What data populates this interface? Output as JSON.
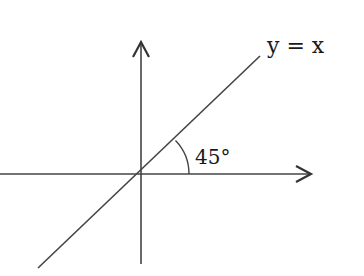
{
  "diagram": {
    "line_label": "y = x",
    "angle_label": "45°",
    "colors": {
      "line": "#444444",
      "text": "#1a1a1a",
      "background": "#ffffff"
    },
    "geometry": {
      "origin": [
        141,
        174
      ],
      "x_axis": {
        "from": [
          0,
          174
        ],
        "to": [
          312,
          174
        ]
      },
      "y_axis": {
        "from": [
          141,
          264
        ],
        "to": [
          141,
          42
        ]
      },
      "diagonal": {
        "from": [
          38,
          268
        ],
        "to": [
          260,
          56
        ]
      },
      "arc_radius": 48
    }
  }
}
